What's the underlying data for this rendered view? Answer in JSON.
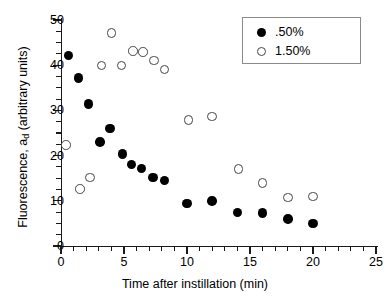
{
  "chart_data": {
    "type": "scatter",
    "title": "",
    "xlabel": "Time after instillation (min)",
    "ylabel": "Fluorescence, a_d (arbitrary units)",
    "ylabel_prefix": "Fluorescence, a",
    "ylabel_sub": "d",
    "ylabel_suffix": " (arbitrary units)",
    "xlim": [
      0,
      25
    ],
    "ylim": [
      0,
      50
    ],
    "xticks": [
      0,
      5,
      10,
      15,
      20,
      25
    ],
    "yticks": [
      0,
      10,
      20,
      30,
      40,
      50
    ],
    "xtick_labels": [
      "0",
      "5",
      "10",
      "15",
      "20",
      "25"
    ],
    "ytick_labels": [
      "0",
      "10",
      "20",
      "30",
      "40",
      "50"
    ],
    "x_minor_step": 1,
    "y_minor_step": 2.5,
    "grid": false,
    "legend_position": "top-right",
    "series": [
      {
        "name": ".50%",
        "marker": "filled-circle",
        "color": "#000000",
        "points": [
          {
            "x": 0.6,
            "y": 42.2
          },
          {
            "x": 1.4,
            "y": 37.2
          },
          {
            "x": 2.2,
            "y": 31.4
          },
          {
            "x": 3.1,
            "y": 23.0
          },
          {
            "x": 3.9,
            "y": 26.0
          },
          {
            "x": 4.9,
            "y": 20.4
          },
          {
            "x": 5.6,
            "y": 18.0
          },
          {
            "x": 6.4,
            "y": 17.2
          },
          {
            "x": 7.3,
            "y": 15.2
          },
          {
            "x": 8.2,
            "y": 14.5
          },
          {
            "x": 10.0,
            "y": 9.4
          },
          {
            "x": 12.0,
            "y": 10.0
          },
          {
            "x": 14.0,
            "y": 7.4
          },
          {
            "x": 16.0,
            "y": 7.3
          },
          {
            "x": 18.0,
            "y": 6.0
          },
          {
            "x": 20.0,
            "y": 5.0
          }
        ]
      },
      {
        "name": "1.50%",
        "marker": "open-circle",
        "color": "#ffffff",
        "points": [
          {
            "x": 0.4,
            "y": 22.4
          },
          {
            "x": 1.5,
            "y": 12.6
          },
          {
            "x": 2.3,
            "y": 15.2
          },
          {
            "x": 3.2,
            "y": 39.9
          },
          {
            "x": 4.0,
            "y": 47.1
          },
          {
            "x": 4.8,
            "y": 39.9
          },
          {
            "x": 5.7,
            "y": 43.1
          },
          {
            "x": 6.5,
            "y": 42.9
          },
          {
            "x": 7.4,
            "y": 41.0
          },
          {
            "x": 8.2,
            "y": 39.0
          },
          {
            "x": 10.1,
            "y": 27.9
          },
          {
            "x": 12.0,
            "y": 28.6
          },
          {
            "x": 14.1,
            "y": 17.0
          },
          {
            "x": 16.0,
            "y": 13.9
          },
          {
            "x": 18.0,
            "y": 10.7
          },
          {
            "x": 20.0,
            "y": 11.0
          }
        ]
      }
    ]
  },
  "legend": {
    "entries": [
      {
        "label": ".50%",
        "marker": "filled-circle"
      },
      {
        "label": "1.50%",
        "marker": "open-circle"
      }
    ]
  }
}
